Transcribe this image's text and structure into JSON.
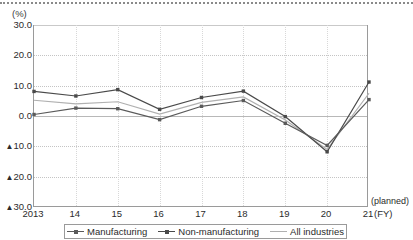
{
  "axis": {
    "unit_label": "(%)",
    "y_ticks": [
      "30.0",
      "20.0",
      "10.0",
      "0.0",
      "▲10.0",
      "▲20.0",
      "▲30.0"
    ],
    "y_values": [
      30,
      20,
      10,
      0,
      -10,
      -20,
      -30
    ],
    "x_ticks": [
      "2013",
      "14",
      "15",
      "16",
      "17",
      "18",
      "19",
      "20",
      "21"
    ],
    "planned_note": "(planned)",
    "fy_note": "(FY)"
  },
  "legend": {
    "items": [
      {
        "label": "Manufacturing",
        "color": "#5a5a5a",
        "marker": true
      },
      {
        "label": "Non-manufacturing",
        "color": "#4a4a4a",
        "marker": true
      },
      {
        "label": "All industries",
        "color": "#b0b0b0",
        "marker": false
      }
    ]
  },
  "colors": {
    "manufacturing": "#5a5a5a",
    "non_manufacturing": "#4a4a4a",
    "all_industries": "#b0b0b0",
    "axis": "#9a9a9a",
    "grid": "#c4c4c4"
  },
  "chart_data": {
    "type": "line",
    "title": "",
    "xlabel": "(FY)",
    "ylabel": "(%)",
    "ylim": [
      -30,
      30
    ],
    "grid": true,
    "legend_position": "bottom",
    "categories": [
      "2013",
      "14",
      "15",
      "16",
      "17",
      "18",
      "19",
      "20",
      "21"
    ],
    "annotations": [
      "(planned)"
    ],
    "series": [
      {
        "name": "Manufacturing",
        "values": [
          0.5,
          2.6,
          2.4,
          -1.2,
          3.2,
          5.1,
          -2.4,
          -9.7,
          5.4
        ]
      },
      {
        "name": "Non-manufacturing",
        "values": [
          8.1,
          6.6,
          8.7,
          2.2,
          6.1,
          8.2,
          -0.2,
          -11.8,
          11.2
        ]
      },
      {
        "name": "All industries",
        "values": [
          5.2,
          4.0,
          4.7,
          0.6,
          4.5,
          6.3,
          -1.3,
          -11.0,
          7.5
        ]
      }
    ]
  }
}
